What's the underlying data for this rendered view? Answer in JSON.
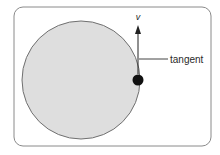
{
  "diagram": {
    "frame": {
      "x": 14,
      "y": 7,
      "width": 197,
      "height": 139,
      "corner_radius": 9,
      "stroke": "#8a8a8a",
      "fill": "#ffffff"
    },
    "circle": {
      "cx": 81,
      "cy": 80,
      "r": 59,
      "fill": "#dedede",
      "stroke": "#707070"
    },
    "particle": {
      "cx": 138,
      "cy": 80,
      "r": 5.5,
      "fill": "#111111"
    },
    "velocity_arrow": {
      "x": 138,
      "y_start": 74,
      "y_end": 26,
      "color": "#222222",
      "label": "v"
    },
    "tangent_leader": {
      "x1": 139,
      "y1": 59,
      "x2": 168,
      "y2": 59,
      "color": "#444444",
      "label": "tangent"
    }
  }
}
